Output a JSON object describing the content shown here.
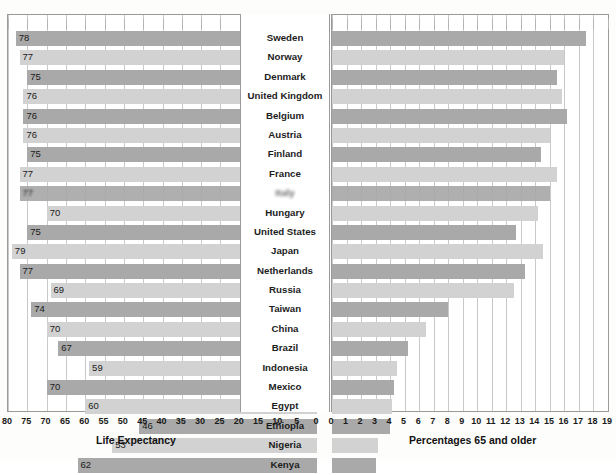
{
  "chart_data": {
    "type": "bar",
    "title": "",
    "orientation": "horizontal-bidirectional",
    "categories": [
      "Sweden",
      "Norway",
      "Denmark",
      "United Kingdom",
      "Belgium",
      "Austria",
      "Finland",
      "France",
      "Italy",
      "Hungary",
      "United States",
      "Japan",
      "Netherlands",
      "Russia",
      "Taiwan",
      "China",
      "Brazil",
      "Indonesia",
      "Mexico",
      "Egypt",
      "Ethiopia",
      "Nigeria",
      "Kenya"
    ],
    "series": [
      {
        "name": "Life Expectancy",
        "axis": "left",
        "xlabel": "Life Expectancy",
        "xlim": [
          80,
          0
        ],
        "reversed": true,
        "ticks": [
          80,
          75,
          70,
          65,
          60,
          55,
          50,
          45,
          40,
          35,
          30,
          25,
          20,
          15,
          10,
          5,
          0
        ],
        "values": [
          78,
          77,
          75,
          76,
          76,
          76,
          75,
          77,
          77,
          70,
          75,
          79,
          77,
          69,
          74,
          70,
          67,
          59,
          70,
          60,
          46,
          53,
          62
        ],
        "labels": [
          "78",
          "77",
          "75",
          "76",
          "76",
          "76",
          "75",
          "77",
          "77",
          "70",
          "75",
          "79",
          "77",
          "69",
          "74",
          "70",
          "67",
          "59",
          "70",
          "60",
          "46",
          "53",
          "62"
        ]
      },
      {
        "name": "Percentages 65 and older",
        "axis": "right",
        "xlabel": "Percentages 65 and older",
        "xlim": [
          0,
          19
        ],
        "reversed": false,
        "ticks": [
          0,
          1,
          2,
          3,
          4,
          5,
          6,
          7,
          8,
          9,
          10,
          11,
          12,
          13,
          14,
          15,
          16,
          17,
          18,
          19
        ],
        "values": [
          17.5,
          16.0,
          15.5,
          15.8,
          16.2,
          15.0,
          14.4,
          15.5,
          15.0,
          14.2,
          12.7,
          14.5,
          13.3,
          12.5,
          8.0,
          6.5,
          5.2,
          4.5,
          4.3,
          4.1,
          4.0,
          3.2,
          3.0
        ]
      }
    ],
    "grid": true,
    "legend": "none",
    "colors": {
      "bar_dark": "#a9a9a9",
      "bar_light": "#d2d2d2",
      "gridline": "#c9c9c9",
      "frame": "#9a9a9a",
      "background": "#ffffff",
      "text": "#1a1a1a"
    },
    "notes": {
      "obscured_row": "Row 9 country label and bar are blurred/illegible in the source image"
    }
  },
  "axes": {
    "left": {
      "title": "Life Expectancy",
      "tick_labels": [
        "80",
        "75",
        "70",
        "65",
        "60",
        "55",
        "50",
        "45",
        "40",
        "35",
        "30",
        "25",
        "20",
        "15",
        "10",
        "5",
        "0"
      ]
    },
    "right": {
      "title": "Percentages 65 and older",
      "tick_labels": [
        "0",
        "1",
        "2",
        "3",
        "4",
        "5",
        "6",
        "7",
        "8",
        "9",
        "10",
        "11",
        "12",
        "13",
        "14",
        "15",
        "16",
        "17",
        "18",
        "19"
      ]
    }
  }
}
